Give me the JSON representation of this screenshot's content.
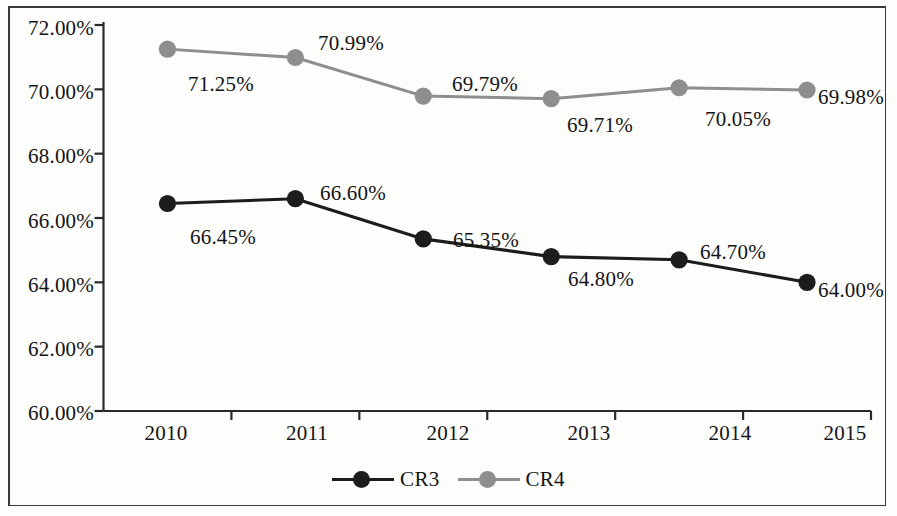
{
  "chart_data": {
    "type": "line",
    "title": "",
    "xlabel": "",
    "ylabel": "",
    "categories": [
      "2010",
      "2011",
      "2012",
      "2013",
      "2014",
      "2015"
    ],
    "ylim": [
      60.0,
      72.0
    ],
    "y_tick_labels": [
      "72.00%",
      "70.00%",
      "68.00%",
      "66.00%",
      "64.00%",
      "62.00%",
      "60.00%"
    ],
    "y_tick_values": [
      72.0,
      70.0,
      68.0,
      66.0,
      64.0,
      62.0,
      60.0
    ],
    "grid": false,
    "legend_position": "bottom-center",
    "series": [
      {
        "name": "CR3",
        "color": "#1c1c1c",
        "values": [
          66.45,
          66.6,
          65.35,
          64.8,
          64.7,
          64.0
        ],
        "labels": [
          "66.45%",
          "66.60%",
          "65.35%",
          "64.80%",
          "64.70%",
          "64.00%"
        ]
      },
      {
        "name": "CR4",
        "color": "#8e8e8e",
        "values": [
          71.25,
          70.99,
          69.79,
          69.71,
          70.05,
          69.98
        ],
        "labels": [
          "71.25%",
          "70.99%",
          "69.79%",
          "69.71%",
          "70.05%",
          "69.98%"
        ]
      }
    ]
  },
  "axis": {
    "y_labels": [
      {
        "text": "72.00%",
        "x": 18,
        "y": 16
      },
      {
        "text": "70.00%",
        "x": 18,
        "y": 80
      },
      {
        "text": "68.00%",
        "x": 18,
        "y": 144
      },
      {
        "text": "66.00%",
        "x": 18,
        "y": 209
      },
      {
        "text": "64.00%",
        "x": 18,
        "y": 273
      },
      {
        "text": "62.00%",
        "x": 18,
        "y": 337
      },
      {
        "text": "60.00%",
        "x": 18,
        "y": 401
      }
    ],
    "x_labels": [
      {
        "text": "2010",
        "x": 166,
        "y": 421
      },
      {
        "text": "2011",
        "x": 307,
        "y": 421
      },
      {
        "text": "2012",
        "x": 448,
        "y": 421
      },
      {
        "text": "2013",
        "x": 589,
        "y": 421
      },
      {
        "text": "2014",
        "x": 730,
        "y": 421
      },
      {
        "text": "2015",
        "x": 845,
        "y": 421
      }
    ]
  },
  "data_labels": [
    {
      "series": "CR4",
      "text": "71.25%",
      "x": 188,
      "y": 72
    },
    {
      "series": "CR4",
      "text": "70.99%",
      "x": 318,
      "y": 31
    },
    {
      "series": "CR4",
      "text": "69.79%",
      "x": 452,
      "y": 72
    },
    {
      "series": "CR4",
      "text": "69.71%",
      "x": 567,
      "y": 113
    },
    {
      "series": "CR4",
      "text": "70.05%",
      "x": 705,
      "y": 107
    },
    {
      "series": "CR4",
      "text": "69.98%",
      "x": 818,
      "y": 85
    },
    {
      "series": "CR3",
      "text": "66.45%",
      "x": 190,
      "y": 225
    },
    {
      "series": "CR3",
      "text": "66.60%",
      "x": 320,
      "y": 181
    },
    {
      "series": "CR3",
      "text": "65.35%",
      "x": 453,
      "y": 228
    },
    {
      "series": "CR3",
      "text": "64.80%",
      "x": 568,
      "y": 267
    },
    {
      "series": "CR3",
      "text": "64.70%",
      "x": 700,
      "y": 240
    },
    {
      "series": "CR3",
      "text": "64.00%",
      "x": 818,
      "y": 278
    }
  ],
  "legend": {
    "items": [
      {
        "label": "CR3",
        "color": "#1c1c1c"
      },
      {
        "label": "CR4",
        "color": "#8e8e8e"
      }
    ]
  }
}
